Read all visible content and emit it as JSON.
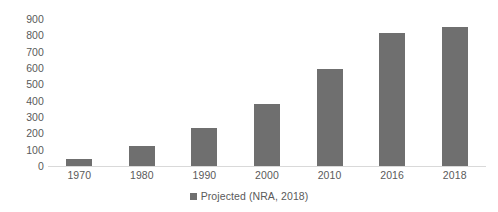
{
  "chart_data": {
    "type": "bar",
    "title": "",
    "subtitle": "",
    "xlabel": "",
    "ylabel": "",
    "categories": [
      "1970",
      "1980",
      "1990",
      "2000",
      "2010",
      "2016",
      "2018"
    ],
    "values": [
      40,
      120,
      235,
      380,
      595,
      815,
      850
    ],
    "series": [
      {
        "name": "Projected (NRA, 2018)",
        "values": [
          40,
          120,
          235,
          380,
          595,
          815,
          850
        ],
        "color": "#6f6f6f"
      }
    ],
    "ylim": [
      0,
      900
    ],
    "y_ticks": [
      0,
      100,
      200,
      300,
      400,
      500,
      600,
      700,
      800,
      900
    ],
    "y_tick_labels": [
      "0",
      "100",
      "200",
      "300",
      "400",
      "500",
      "600",
      "700",
      "800",
      "900"
    ],
    "grid": false,
    "legend": {
      "position": "bottom",
      "entries": [
        {
          "label": "Projected (NRA, 2018)",
          "marker": "square-swatch",
          "color": "#6f6f6f"
        }
      ]
    },
    "colors": {
      "bar": "#6f6f6f",
      "text": "#5a5a5a",
      "axis_line": "#d9d9d9",
      "background": "#ffffff"
    }
  }
}
